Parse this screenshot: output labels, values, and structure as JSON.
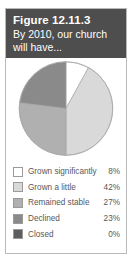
{
  "figure": {
    "title": "Figure 12.11.3",
    "subtitle": "By 2010, our church will have...",
    "header_bg": "#4e4e4e",
    "header_text_color": "#ffffff",
    "border_color": "#b9b9b9"
  },
  "chart_data": {
    "type": "pie",
    "title": "By 2010, our church will have...",
    "categories": [
      "Grown significantly",
      "Grown a little",
      "Remained stable",
      "Declined",
      "Closed"
    ],
    "values": [
      8,
      42,
      27,
      23,
      0
    ],
    "value_labels": [
      "8%",
      "42%",
      "27%",
      "23%",
      "0%"
    ],
    "colors": [
      "#ffffff",
      "#d9d9d9",
      "#b0b0b0",
      "#8a8a8a",
      "#5e5e5e"
    ],
    "unit": "%",
    "start_angle_oclock": 12,
    "direction": "clockwise",
    "legend_position": "bottom",
    "grid": false
  },
  "legend": {
    "rows": [
      {
        "label": "Grown significantly",
        "value": "8%",
        "color": "#ffffff"
      },
      {
        "label": "Grown a little",
        "value": "42%",
        "color": "#d9d9d9"
      },
      {
        "label": "Remained stable",
        "value": "27%",
        "color": "#b0b0b0"
      },
      {
        "label": "Declined",
        "value": "23%",
        "color": "#8a8a8a"
      },
      {
        "label": "Closed",
        "value": "0%",
        "color": "#5e5e5e"
      }
    ]
  }
}
